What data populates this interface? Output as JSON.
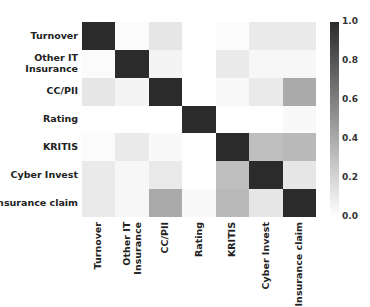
{
  "chart_data": {
    "type": "heatmap",
    "title": "",
    "xlabel": "",
    "ylabel": "",
    "categories": [
      "Turnover",
      "Other IT Insurance",
      "CC/PII",
      "Rating",
      "KRITIS",
      "Cyber Invest",
      "Insurance claim"
    ],
    "x_labels": [
      "Turnover",
      "Other IT\nInsurance",
      "CC/PII",
      "Rating",
      "KRITIS",
      "Cyber Invest",
      "Insurance claim"
    ],
    "y_labels": [
      "Turnover",
      "Other IT\nInsurance",
      "CC/PII",
      "Rating",
      "KRITIS",
      "Cyber Invest",
      "Insurance claim"
    ],
    "matrix": [
      [
        1.0,
        0.02,
        0.12,
        0.0,
        0.02,
        0.1,
        0.1
      ],
      [
        0.02,
        1.0,
        0.05,
        0.0,
        0.1,
        0.04,
        0.04
      ],
      [
        0.12,
        0.05,
        1.0,
        0.0,
        0.03,
        0.1,
        0.4
      ],
      [
        0.0,
        0.0,
        0.0,
        1.0,
        0.0,
        0.0,
        0.03
      ],
      [
        0.02,
        0.1,
        0.03,
        0.0,
        1.0,
        0.3,
        0.33
      ],
      [
        0.1,
        0.04,
        0.1,
        0.0,
        0.3,
        1.0,
        0.12
      ],
      [
        0.1,
        0.04,
        0.4,
        0.03,
        0.33,
        0.12,
        1.0
      ]
    ],
    "colorbar": {
      "min": 0.0,
      "max": 1.0,
      "ticks": [
        "1.0",
        "0.8",
        "0.6",
        "0.4",
        "0.2",
        "0.0"
      ],
      "color_low": "#ffffff",
      "color_high": "#2b2b2b"
    },
    "legend_position": "right",
    "grid": false
  }
}
